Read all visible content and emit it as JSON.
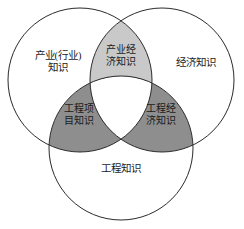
{
  "diagram": {
    "type": "venn-3-circle",
    "background_color": "#ffffff",
    "stroke_color": "#2b2b2b",
    "fill_light_gray": "#c9c9c9",
    "fill_dark_gray": "#8e8e8e",
    "fill_white": "#ffffff",
    "circles": [
      {
        "id": "industry",
        "label": "产业(行业)\n知识",
        "cx": 80,
        "cy": 80,
        "r": 72
      },
      {
        "id": "economy",
        "label": "经济知识",
        "cx": 162,
        "cy": 80,
        "r": 72
      },
      {
        "id": "engineering",
        "label": "工程知识",
        "cx": 121,
        "cy": 148,
        "r": 72
      }
    ],
    "intersections": [
      {
        "id": "industry-economy",
        "label": "产业经\n济知识",
        "shade": "light"
      },
      {
        "id": "industry-engineering",
        "label": "工程项\n目知识",
        "shade": "dark"
      },
      {
        "id": "economy-engineering",
        "label": "工程经\n济知识",
        "shade": "dark"
      },
      {
        "id": "all-three",
        "label": "",
        "shade": "none"
      }
    ]
  },
  "labels": {
    "industry": "产业(行业)\n知识",
    "economy": "经济知识",
    "engineering": "工程知识",
    "industry_economy": "产业经\n济知识",
    "engineering_project": "工程项\n目知识",
    "engineering_economy": "工程经\n济知识"
  }
}
